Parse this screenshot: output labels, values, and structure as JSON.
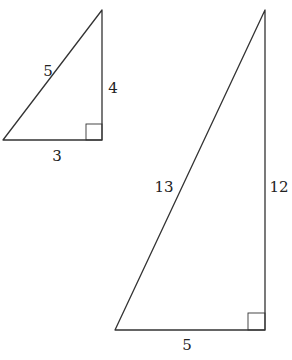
{
  "diagram": {
    "title": "",
    "triangles": [
      {
        "id": "small",
        "vertices": [
          [
            3,
            140
          ],
          [
            102,
            140
          ],
          [
            102,
            10
          ]
        ],
        "right_angle_box": {
          "x": 86,
          "y": 124,
          "size": 16
        },
        "labels": {
          "hypotenuse": {
            "text": "5",
            "x": 48,
            "y": 76
          },
          "vertical_leg": {
            "text": "4",
            "x": 113,
            "y": 93
          },
          "base": {
            "text": "3",
            "x": 57,
            "y": 161
          }
        }
      },
      {
        "id": "large",
        "vertices": [
          [
            115,
            330
          ],
          [
            265,
            330
          ],
          [
            265,
            10
          ]
        ],
        "right_angle_box": {
          "x": 248,
          "y": 313,
          "size": 17
        },
        "labels": {
          "hypotenuse": {
            "text": "13",
            "x": 164,
            "y": 192
          },
          "vertical_leg": {
            "text": "12",
            "x": 279,
            "y": 192
          },
          "base": {
            "text": "5",
            "x": 187,
            "y": 350
          }
        }
      }
    ],
    "colors": {
      "stroke": "#333333",
      "text": "#222222",
      "background": "#ffffff"
    }
  }
}
